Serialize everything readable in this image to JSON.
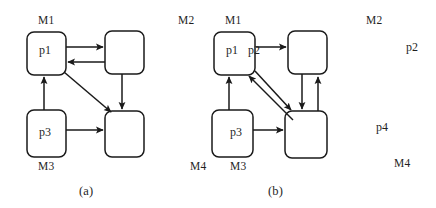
{
  "figure": {
    "caption_a": "(a)",
    "caption_b": "(b)",
    "stroke_color": "#1a1a1a",
    "background_color": "#ffffff"
  },
  "diagram_a": {
    "name": "(a)",
    "nodes": [
      {
        "id": "a-m1",
        "label": "p1",
        "machine_label": "M1",
        "x": 27,
        "y": 32,
        "w": 39,
        "h": 43
      },
      {
        "id": "a-m2",
        "label": "",
        "machine_label": "",
        "x": 105,
        "y": 31,
        "w": 39,
        "h": 43
      },
      {
        "id": "a-m3",
        "label": "p3",
        "machine_label": "M3",
        "x": 27,
        "y": 110,
        "w": 39,
        "h": 47
      },
      {
        "id": "a-m4",
        "label": "",
        "machine_label": "",
        "x": 105,
        "y": 111,
        "w": 39,
        "h": 46
      }
    ],
    "machine_labels": [
      {
        "text": "M1",
        "x": 38,
        "y": 15
      },
      {
        "text": "M3",
        "x": 38,
        "y": 161
      }
    ],
    "place_labels": [
      {
        "text": "p1",
        "x": 39,
        "y": 44
      },
      {
        "text": "p3",
        "x": 39,
        "y": 126
      }
    ],
    "edges": [
      {
        "from": "a-m1",
        "to": "a-m2",
        "kind": "horizontal-right"
      },
      {
        "from": "a-m2",
        "to": "a-m1",
        "kind": "horizontal-left"
      },
      {
        "from": "a-m1",
        "to": "a-m4",
        "kind": "diagonal-down-right"
      },
      {
        "from": "a-m3",
        "to": "a-m1",
        "kind": "vertical-up"
      },
      {
        "from": "a-m2",
        "to": "a-m4",
        "kind": "vertical-down"
      },
      {
        "from": "a-m3",
        "to": "a-m4",
        "kind": "horizontal-right"
      }
    ]
  },
  "diagram_b": {
    "name": "(b)",
    "nodes": [
      {
        "id": "b-m1",
        "label": "p1",
        "machine_label": "M1",
        "x": 214,
        "y": 32,
        "w": 41,
        "h": 43
      },
      {
        "id": "b-m2",
        "label": "",
        "machine_label": "",
        "x": 288,
        "y": 31,
        "w": 39,
        "h": 43
      },
      {
        "id": "b-m3",
        "label": "p3",
        "machine_label": "M3",
        "x": 212,
        "y": 110,
        "w": 41,
        "h": 47
      },
      {
        "id": "b-m4",
        "label": "",
        "machine_label": "",
        "x": 285,
        "y": 111,
        "w": 42,
        "h": 47
      }
    ],
    "machine_labels": [
      {
        "text": "M2",
        "x": 178,
        "y": 15
      },
      {
        "text": "M1",
        "x": 225,
        "y": 15
      },
      {
        "text": "M4",
        "x": 190,
        "y": 161
      },
      {
        "text": "M3",
        "x": 230,
        "y": 161
      }
    ],
    "place_labels": [
      {
        "text": "p1",
        "x": 226,
        "y": 44
      },
      {
        "text": "p2",
        "x": 248,
        "y": 44
      },
      {
        "text": "p3",
        "x": 230,
        "y": 126
      }
    ],
    "edges": [
      {
        "from": "b-m1",
        "to": "b-m2",
        "kind": "horizontal-right"
      },
      {
        "from": "b-m1",
        "to": "b-m4",
        "kind": "diagonal-down-right"
      },
      {
        "from": "b-m4",
        "to": "b-m1",
        "kind": "diagonal-up-left"
      },
      {
        "from": "b-m3",
        "to": "b-m1",
        "kind": "vertical-up"
      },
      {
        "from": "b-m2",
        "to": "b-m4",
        "kind": "vertical-down"
      },
      {
        "from": "b-m4",
        "to": "b-m2",
        "kind": "vertical-up"
      },
      {
        "from": "b-m3",
        "to": "b-m4",
        "kind": "horizontal-right"
      }
    ]
  },
  "side_labels": [
    {
      "text": "M2",
      "x": 366,
      "y": 15
    },
    {
      "text": "p2",
      "x": 406,
      "y": 41
    },
    {
      "text": "p4",
      "x": 376,
      "y": 121
    },
    {
      "text": "M4",
      "x": 394,
      "y": 158
    }
  ]
}
